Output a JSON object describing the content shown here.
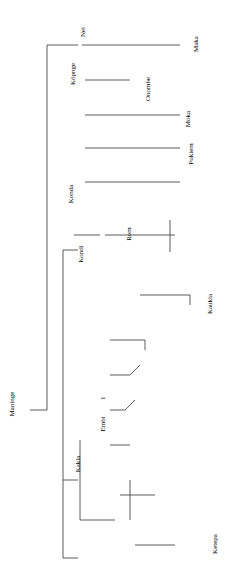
{
  "diagram": {
    "type": "kinship-chart",
    "orientation": "rotated-90",
    "root": {
      "name": "Maninge",
      "bracket": "Kuri"
    },
    "labels": {
      "kakla": "Kakla",
      "embi": "Embi",
      "embi_clan": "(Kikipukla)",
      "kondi": "Kondi",
      "konda": "Konda",
      "kim": "Kim",
      "woyo": "Woyo",
      "ru": "Ru",
      "kopnge": "Köpnge",
      "nei": "Nei",
      "maka": "Maka",
      "ndakle": "Ndakle",
      "onombe": "Onombe",
      "onombe_note": "(unmarried)",
      "moka1": "Moka",
      "moka1_note": "(lives elsewhere)",
      "pukiem": "Pukiem",
      "nendipu": "Nendipu",
      "nendipu_note": "(lives elsewhere)",
      "rom": "Rom",
      "rom_clan": "(Kombukla)",
      "parle": "Parle",
      "wömndi": "Wömndi",
      "kombukla": "(Kombukla)",
      "kaukla": "Kaukla",
      "moka2": "Moka",
      "poki": "Poki",
      "poki_note": "(see (1))",
      "tipuka": "(Tipuka)",
      "romon": "Romon",
      "nukint2": "Nukint",
      "pepu": "Pepu",
      "nukint1": "Nukint",
      "pangk": "Pangk",
      "ndamba": "Ndamba",
      "konga": "Konga",
      "pana": "Pana",
      "kumndi": "(Kumndi)",
      "kombukla2": "(Kombukla)",
      "kuperi": "Kuperi",
      "kope1": "(Kope)",
      "wamb": "Wamb",
      "rongnda": "Rongnda",
      "pil": "Pil",
      "rambe": "Rambe",
      "kope2": "(Kope)",
      "ketepa": "Ketepa",
      "n1": "1",
      "n2": "2",
      "n3": "3"
    }
  }
}
